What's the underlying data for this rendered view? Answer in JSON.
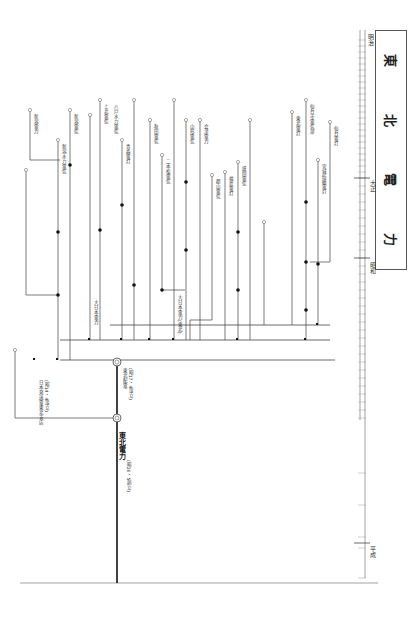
{
  "title": {
    "chars": [
      "東",
      "北",
      "電",
      "力"
    ]
  },
  "timeline": {
    "eras": [
      {
        "name": "明治",
        "y": 38
      },
      {
        "name": "大正",
        "y": 180
      },
      {
        "name": "昭和",
        "y": 260
      },
      {
        "name": "平成",
        "y": 545
      }
    ],
    "labels_note": "year ticks along right vertical axis"
  },
  "final_company": {
    "name": "東北電力",
    "note": "(昭26・5創立)"
  },
  "intermediate": {
    "name": "東北配電",
    "note": "(昭17・4設立)"
  },
  "nippon_hassoden": {
    "name": "日本発送電東北支店",
    "note": "(昭14・4設立)"
  },
  "companies": [
    {
      "name": "仙台電灯",
      "x": 330
    },
    {
      "name": "宮城紡績電灯",
      "x": 318
    },
    {
      "name": "仙台市電気部",
      "x": 306
    },
    {
      "name": "東北電灯",
      "x": 292
    },
    {
      "name": "盛岡電気",
      "x": 238
    },
    {
      "name": "福島電灯",
      "x": 225
    },
    {
      "name": "郡山電気",
      "x": 212
    },
    {
      "name": "会津電力",
      "x": 200
    },
    {
      "name": "山形電気",
      "x": 186
    },
    {
      "name": "二本松電気",
      "x": 162
    },
    {
      "name": "秋田電気",
      "x": 150
    },
    {
      "name": "青森電灯",
      "x": 122
    },
    {
      "name": "八戸水力電気",
      "x": 110
    },
    {
      "name": "上北電気",
      "x": 100
    },
    {
      "name": "新潟電気",
      "x": 70
    },
    {
      "name": "新潟水力電気",
      "x": 58
    },
    {
      "name": "新潟電力",
      "x": 28
    }
  ],
  "merge_labels": [
    {
      "text": "大日本電力",
      "x": 92,
      "y": 330
    },
    {
      "text": "大日本電力(東北)",
      "x": 175,
      "y": 330
    },
    {
      "text": "東北振興電力",
      "x": 40,
      "y": 420
    }
  ]
}
